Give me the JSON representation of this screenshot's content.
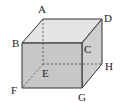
{
  "diagram": {
    "type": "cube",
    "vertices": {
      "A": {
        "label": "A",
        "x": 43,
        "y": 19,
        "lx": 38,
        "ly": 13
      },
      "B": {
        "label": "B",
        "x": 22,
        "y": 43,
        "lx": 12,
        "ly": 47
      },
      "C": {
        "label": "C",
        "x": 82,
        "y": 43,
        "lx": 84,
        "ly": 53
      },
      "D": {
        "label": "D",
        "x": 102,
        "y": 19,
        "lx": 104,
        "ly": 22
      },
      "E": {
        "label": "E",
        "x": 43,
        "y": 64,
        "lx": 42,
        "ly": 77
      },
      "F": {
        "label": "F",
        "x": 22,
        "y": 88,
        "lx": 11,
        "ly": 94
      },
      "G": {
        "label": "G",
        "x": 82,
        "y": 88,
        "lx": 78,
        "ly": 101
      },
      "H": {
        "label": "H",
        "x": 102,
        "y": 64,
        "lx": 105,
        "ly": 70
      }
    },
    "hidden_edges": [
      "AE",
      "EF",
      "EH"
    ],
    "colors": {
      "front_face": "#b9b9b9",
      "top_face": "#e2e2e2",
      "right_face": "#c8c8c8",
      "edge": "#333333"
    }
  }
}
